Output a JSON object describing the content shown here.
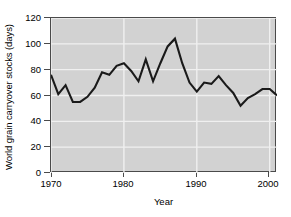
{
  "chart_data": {
    "type": "line",
    "title": "",
    "xlabel": "Year",
    "ylabel": "World grain carryover stocks (days)",
    "xlim": [
      1970,
      2001
    ],
    "ylim": [
      0,
      120
    ],
    "grid": true,
    "legend": null,
    "gridline_color": "#f0f0f0",
    "plot_background": "#d2d2d2",
    "line_color": "#1a1a1a",
    "axis_color": "#4a4a4a",
    "ytick_labels": [
      "0",
      "20",
      "40",
      "60",
      "80",
      "100",
      "120"
    ],
    "ytick_values": [
      0,
      20,
      40,
      60,
      80,
      100,
      120
    ],
    "xtick_labels": [
      "1970",
      "1980",
      "1990",
      "2000"
    ],
    "xtick_values": [
      1970,
      1980,
      1990,
      2000
    ],
    "x": [
      1970,
      1971,
      1972,
      1973,
      1974,
      1975,
      1976,
      1977,
      1978,
      1979,
      1980,
      1981,
      1982,
      1983,
      1984,
      1985,
      1986,
      1987,
      1988,
      1989,
      1990,
      1991,
      1992,
      1993,
      1994,
      1995,
      1996,
      1997,
      1998,
      1999,
      2000,
      2001
    ],
    "values": [
      76,
      61,
      68,
      55,
      55,
      59,
      66,
      78,
      76,
      83,
      85,
      79,
      71,
      88,
      71,
      85,
      98,
      104,
      85,
      70,
      63,
      70,
      69,
      75,
      68,
      62,
      52,
      58,
      61,
      65,
      65,
      60
    ],
    "series": [
      {
        "name": "World grain carryover stocks",
        "values": [
          76,
          61,
          68,
          55,
          55,
          59,
          66,
          78,
          76,
          83,
          85,
          79,
          71,
          88,
          71,
          85,
          98,
          104,
          85,
          70,
          63,
          70,
          69,
          75,
          68,
          62,
          52,
          58,
          61,
          65,
          65,
          60
        ]
      }
    ]
  },
  "axis": {
    "y_label": "World grain carryover stocks (days)",
    "x_label": "Year"
  }
}
